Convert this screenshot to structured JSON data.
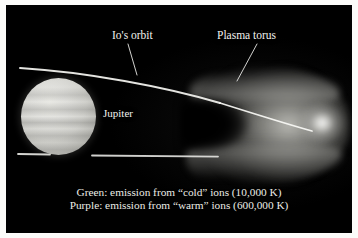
{
  "figure": {
    "frame_color": "#fbfbf9",
    "plate_background": "#000000"
  },
  "labels": {
    "ios_orbit": "Io's orbit",
    "plasma_torus": "Plasma torus",
    "jupiter": "Jupiter"
  },
  "caption": {
    "line1": "Green: emission from “cold” ions (10,000 K)",
    "line2": "Purple: emission from “warm” ions (600,000 K)"
  },
  "legend": [
    {
      "color_name": "Green",
      "ion_state": "“cold”",
      "temperature": "10,000 K"
    },
    {
      "color_name": "Purple",
      "ion_state": "“warm”",
      "temperature": "600,000 K"
    }
  ],
  "features": {
    "jupiter_disk": "bright banded sphere",
    "plasma_torus": "U-shaped glowing torus with bright ansa core",
    "orbit_line_upper": "Io's orbit, upper arc",
    "orbit_line_lower": "Io's orbit, lower arc"
  }
}
